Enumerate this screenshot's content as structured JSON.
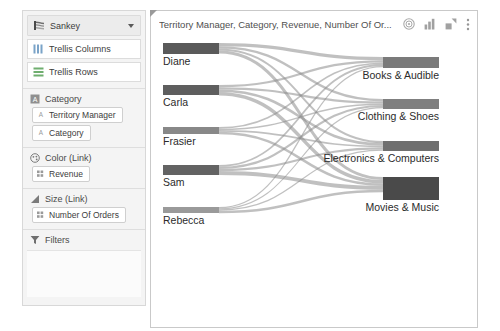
{
  "sidebar": {
    "mark_type": {
      "label": "Sankey",
      "icon": "sankey-icon",
      "caret": "chevron-down-icon"
    },
    "shelves": [
      {
        "label": "Trellis Columns",
        "icon": "trellis-columns-icon"
      },
      {
        "label": "Trellis Rows",
        "icon": "trellis-rows-icon"
      }
    ],
    "sections": [
      {
        "name": "Category",
        "icon": "attribute-icon",
        "pills": [
          {
            "label": "Territory Manager",
            "icon": "attribute-icon"
          },
          {
            "label": "Category",
            "icon": "attribute-icon"
          }
        ]
      },
      {
        "name": "Color (Link)",
        "icon": "color-palette-icon",
        "pills": [
          {
            "label": "Revenue",
            "icon": "measure-icon"
          }
        ]
      },
      {
        "name": "Size (Link)",
        "icon": "size-bars-icon",
        "pills": [
          {
            "label": "Number Of Orders",
            "icon": "measure-icon"
          }
        ]
      },
      {
        "name": "Filters",
        "icon": "filter-funnel-icon",
        "pills": []
      }
    ]
  },
  "chart": {
    "title": "Territory Manager, Category, Revenue, Number Of Or...",
    "header_icons": [
      {
        "name": "target-icon"
      },
      {
        "name": "bar-chart-icon"
      },
      {
        "name": "expand-icon"
      },
      {
        "name": "kebab-menu-icon"
      }
    ]
  },
  "chart_data": {
    "type": "sankey",
    "title": "Territory Manager, Category, Revenue, Number Of Or...",
    "source_label": "Territory Manager",
    "target_label": "Category",
    "value_label": "Number Of Orders",
    "color_label": "Revenue",
    "node_color": "#595959",
    "link_color": "#8c8c8c",
    "sources": [
      {
        "name": "Diane",
        "value": 26,
        "y": 6,
        "height": 11,
        "shade": "#5a5a5a"
      },
      {
        "name": "Carla",
        "value": 24,
        "y": 48,
        "height": 10,
        "shade": "#5e5e5e"
      },
      {
        "name": "Frasier",
        "value": 17,
        "y": 90,
        "height": 7,
        "shade": "#888888"
      },
      {
        "name": "Sam",
        "value": 23,
        "y": 128,
        "height": 10,
        "shade": "#636363"
      },
      {
        "name": "Rebecca",
        "value": 14,
        "y": 170,
        "height": 6,
        "shade": "#9a9a9a"
      }
    ],
    "targets": [
      {
        "name": "Books & Audible",
        "value": 22,
        "y": 20,
        "height": 11,
        "shade": "#7a7a7a"
      },
      {
        "name": "Clothing & Shoes",
        "value": 20,
        "y": 62,
        "height": 10,
        "shade": "#7f7f7f"
      },
      {
        "name": "Electronics & Computers",
        "value": 21,
        "y": 104,
        "height": 10,
        "shade": "#6f6f6f"
      },
      {
        "name": "Movies & Music",
        "value": 41,
        "y": 140,
        "height": 23,
        "shade": "#4a4a4a"
      }
    ],
    "links": [
      {
        "source": "Diane",
        "target": "Books & Audible",
        "value": 8,
        "width": 3.2
      },
      {
        "source": "Diane",
        "target": "Clothing & Shoes",
        "value": 6,
        "width": 2.4
      },
      {
        "source": "Diane",
        "target": "Electronics & Computers",
        "value": 5,
        "width": 2.0
      },
      {
        "source": "Diane",
        "target": "Movies & Music",
        "value": 7,
        "width": 3.0
      },
      {
        "source": "Carla",
        "target": "Books & Audible",
        "value": 5,
        "width": 2.2
      },
      {
        "source": "Carla",
        "target": "Clothing & Shoes",
        "value": 5,
        "width": 2.2
      },
      {
        "source": "Carla",
        "target": "Electronics & Computers",
        "value": 6,
        "width": 2.6
      },
      {
        "source": "Carla",
        "target": "Movies & Music",
        "value": 8,
        "width": 3.4
      },
      {
        "source": "Frasier",
        "target": "Books & Audible",
        "value": 4,
        "width": 1.7
      },
      {
        "source": "Frasier",
        "target": "Clothing & Shoes",
        "value": 3,
        "width": 1.4
      },
      {
        "source": "Frasier",
        "target": "Electronics & Computers",
        "value": 4,
        "width": 1.7
      },
      {
        "source": "Frasier",
        "target": "Movies & Music",
        "value": 6,
        "width": 2.5
      },
      {
        "source": "Sam",
        "target": "Books & Audible",
        "value": 4,
        "width": 1.8
      },
      {
        "source": "Sam",
        "target": "Clothing & Shoes",
        "value": 5,
        "width": 2.1
      },
      {
        "source": "Sam",
        "target": "Electronics & Computers",
        "value": 5,
        "width": 2.2
      },
      {
        "source": "Sam",
        "target": "Movies & Music",
        "value": 9,
        "width": 3.8
      },
      {
        "source": "Rebecca",
        "target": "Books & Audible",
        "value": 3,
        "width": 1.3
      },
      {
        "source": "Rebecca",
        "target": "Clothing & Shoes",
        "value": 2,
        "width": 1.1
      },
      {
        "source": "Rebecca",
        "target": "Electronics & Computers",
        "value": 3,
        "width": 1.3
      },
      {
        "source": "Rebecca",
        "target": "Movies & Music",
        "value": 6,
        "width": 2.6
      }
    ]
  }
}
